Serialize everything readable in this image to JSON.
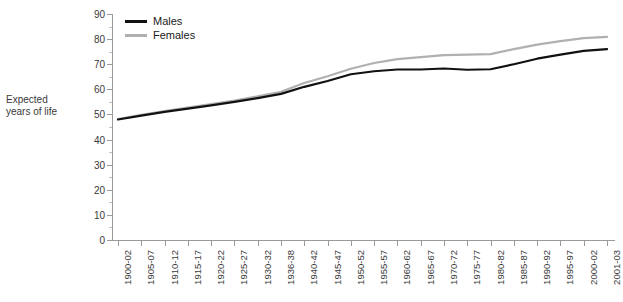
{
  "chart_data": {
    "type": "line",
    "title": "",
    "xlabel": "",
    "ylabel": "Expected years of life",
    "ylim": [
      0,
      90
    ],
    "ytick_step": 10,
    "grid": false,
    "legend_position": "top-left",
    "categories": [
      "1900-02",
      "1905-07",
      "1910-12",
      "1915-17",
      "1920-22",
      "1925-27",
      "1930-32",
      "1936-38",
      "1940-42",
      "1945-47",
      "1950-52",
      "1955-57",
      "1960-62",
      "1965-67",
      "1970-72",
      "1975-77",
      "1980-82",
      "1985-87",
      "1990-92",
      "1995-97",
      "2000-02",
      "2001-03"
    ],
    "yticks": [
      0,
      10,
      20,
      30,
      40,
      50,
      60,
      70,
      80,
      90
    ],
    "series": [
      {
        "name": "Males",
        "color": "#111111",
        "values": [
          48.0,
          49.5,
          51.0,
          52.3,
          53.6,
          55.0,
          56.5,
          58.2,
          61.0,
          63.3,
          66.0,
          67.2,
          67.9,
          67.9,
          68.3,
          67.8,
          68.0,
          70.0,
          72.2,
          73.8,
          75.3,
          76.0
        ]
      },
      {
        "name": "Females",
        "color": "#b0b0b0",
        "values": [
          48.2,
          49.8,
          51.3,
          52.7,
          54.1,
          55.5,
          57.2,
          59.0,
          62.5,
          65.2,
          68.2,
          70.5,
          72.0,
          72.8,
          73.6,
          73.8,
          74.0,
          76.0,
          77.8,
          79.2,
          80.4,
          80.9
        ]
      }
    ]
  },
  "legend": {
    "entries": [
      {
        "label": "Males"
      },
      {
        "label": "Females"
      }
    ]
  },
  "y_axis_title": {
    "line1": "Expected",
    "line2": "years of life"
  }
}
